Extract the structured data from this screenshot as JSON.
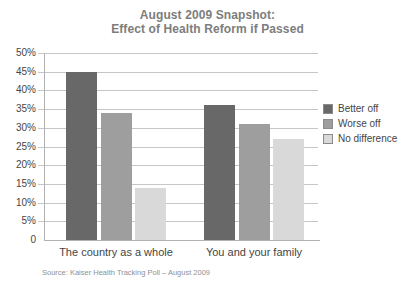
{
  "title": {
    "line1": "August 2009 Snapshot:",
    "line2": "Effect of Health Reform if Passed"
  },
  "source_note": "Source: Kaiser Health Tracking Poll – August 2009",
  "colors": {
    "better_off": "#686868",
    "worse_off": "#9e9e9e",
    "no_difference": "#d9d9d9",
    "gridline": "#c6c6c6",
    "axis": "#b2b2b2",
    "title_text": "#7d7d7d",
    "label_text": "#454545",
    "source_text": "#8f8f8f"
  },
  "chart_data": {
    "type": "bar",
    "title": "August 2009 Snapshot: Effect of Health Reform if Passed",
    "categories": [
      "The country as a whole",
      "You and your family"
    ],
    "series": [
      {
        "name": "Better off",
        "values": [
          45,
          36
        ],
        "color": "#686868"
      },
      {
        "name": "Worse off",
        "values": [
          34,
          31
        ],
        "color": "#9e9e9e"
      },
      {
        "name": "No difference",
        "values": [
          14,
          27
        ],
        "color": "#d9d9d9"
      }
    ],
    "xlabel": "",
    "ylabel": "",
    "ylim": [
      0,
      50
    ],
    "ytick_step": 5,
    "ytick_labels": [
      "0",
      "5%",
      "10%",
      "15%",
      "20%",
      "25%",
      "30%",
      "35%",
      "40%",
      "45%",
      "50%"
    ],
    "grid": true,
    "legend_position": "right",
    "source": "Source: Kaiser Health Tracking Poll – August 2009"
  }
}
